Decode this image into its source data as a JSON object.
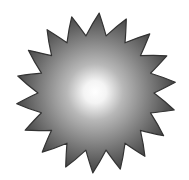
{
  "image": {
    "subject": "sun-icon",
    "ray_count": 18,
    "colors": {
      "center": "#ffffff",
      "mid": "#a8a8a8",
      "edge": "#4a4a4a",
      "outline": "#333333",
      "background": "#ffffff"
    }
  }
}
